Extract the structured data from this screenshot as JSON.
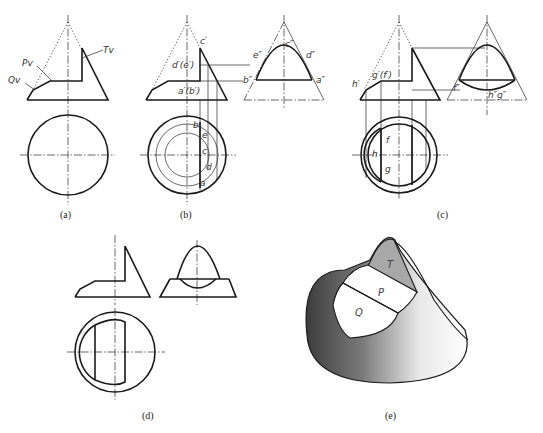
{
  "figure": {
    "panels": [
      {
        "id": "a",
        "caption": "(a)",
        "labels": {
          "Pv": "Pv",
          "Qv": "Qv",
          "Tv": "Tv"
        }
      },
      {
        "id": "b",
        "caption": "(b)",
        "labels": {
          "c_front": "c′",
          "de_front": "d′(e′)",
          "ab_front": "a′(b′)",
          "c_side": "c″",
          "e_side": "e″",
          "d_side": "d″",
          "b_side": "b″",
          "a_side": "a″",
          "b_top": "b",
          "e_top": "e",
          "c_top": "c",
          "d_top": "d",
          "a_top": "a"
        }
      },
      {
        "id": "c",
        "caption": "(c)",
        "labels": {
          "h_front": "h′",
          "gf_front": "g′(f′)",
          "f_side": "f″",
          "hg_side": "h″g″",
          "f_top": "f",
          "h_top": "h",
          "g_top": "g"
        }
      },
      {
        "id": "d",
        "caption": "(d)"
      },
      {
        "id": "e",
        "caption": "(e)",
        "labels": {
          "T": "T",
          "P": "P",
          "Q": "Q"
        }
      }
    ]
  }
}
